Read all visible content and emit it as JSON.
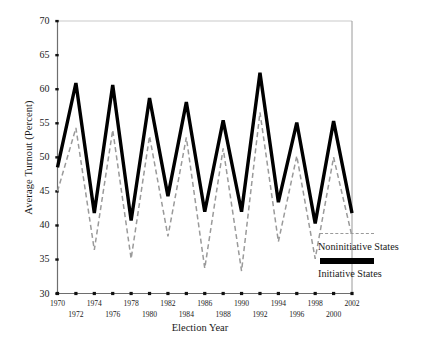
{
  "chart_data": {
    "type": "line",
    "title": "",
    "xlabel": "Election Year",
    "ylabel": "Average Turnout (Percent)",
    "xlim": [
      1970,
      2002
    ],
    "ylim": [
      30,
      70
    ],
    "yticks": [
      30,
      35,
      40,
      45,
      50,
      55,
      60,
      65,
      70
    ],
    "grid": false,
    "legend_position": "right",
    "x": [
      1970,
      1972,
      1974,
      1976,
      1978,
      1980,
      1982,
      1984,
      1986,
      1988,
      1990,
      1992,
      1994,
      1996,
      1998,
      2000,
      2002
    ],
    "series": [
      {
        "name": "Initiative States",
        "style": "solid-thick",
        "color": "#000000",
        "values": [
          48.5,
          60.9,
          41.8,
          60.6,
          40.7,
          58.7,
          44.3,
          58.1,
          42.0,
          55.4,
          42.0,
          62.4,
          43.4,
          55.1,
          40.3,
          55.3,
          41.8
        ]
      },
      {
        "name": "Noninitiative States",
        "style": "dashed-thin",
        "color": "#9a9a9a",
        "values": [
          45.0,
          54.3,
          36.4,
          54.0,
          35.1,
          53.1,
          38.4,
          52.9,
          33.7,
          51.3,
          33.3,
          56.6,
          37.6,
          50.2,
          35.1,
          50.0,
          38.4
        ]
      }
    ]
  },
  "axes": {
    "y_label": "Average Turnout (Percent)",
    "x_label": "Election Year",
    "y_ticks": [
      "70",
      "65",
      "60",
      "55",
      "50",
      "45",
      "40",
      "35",
      "30"
    ],
    "x_ticks_top_row": [
      "1970",
      "1974",
      "1978",
      "1982",
      "1986",
      "1990",
      "1994",
      "1998",
      "2002"
    ],
    "x_ticks_bottom_row": [
      "1972",
      "1976",
      "1980",
      "1984",
      "1988",
      "1992",
      "1996",
      "2000"
    ]
  },
  "legend": {
    "entries": [
      {
        "label": "Noninitiative States",
        "swatch": "dashed-line-swatch"
      },
      {
        "label": "Initiative States",
        "swatch": "solid-line-swatch"
      }
    ]
  }
}
